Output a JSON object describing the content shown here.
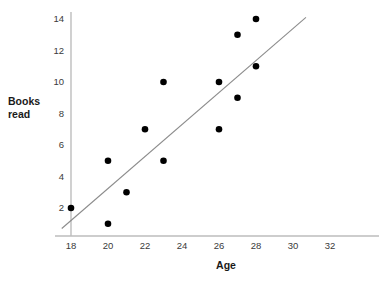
{
  "chart_data": {
    "type": "scatter",
    "title": "",
    "xlabel": "Age",
    "ylabel": "Books read",
    "xlim": [
      17.2,
      33.2
    ],
    "ylim": [
      0.2,
      14.8
    ],
    "xticks": [
      18,
      20,
      22,
      24,
      26,
      28,
      30,
      32
    ],
    "yticks": [
      2,
      4,
      6,
      8,
      10,
      12,
      14
    ],
    "xtick_labels": [
      "18",
      "20",
      "22",
      "24",
      "26",
      "28",
      "30",
      "32"
    ],
    "ytick_labels": [
      "2",
      "4",
      "6",
      "8",
      "10",
      "12",
      "14"
    ],
    "grid": false,
    "legend": null,
    "x": [
      18,
      20,
      20,
      21,
      22,
      23,
      23,
      26,
      26,
      27,
      27,
      28,
      28
    ],
    "y": [
      2,
      5,
      1,
      3,
      7,
      10,
      5,
      10,
      7,
      13,
      9,
      14,
      11
    ],
    "points": [
      {
        "x": 18,
        "y": 2
      },
      {
        "x": 20,
        "y": 5
      },
      {
        "x": 20,
        "y": 1
      },
      {
        "x": 21,
        "y": 3
      },
      {
        "x": 22,
        "y": 7
      },
      {
        "x": 23,
        "y": 10
      },
      {
        "x": 23,
        "y": 5
      },
      {
        "x": 26,
        "y": 10
      },
      {
        "x": 26,
        "y": 7
      },
      {
        "x": 27,
        "y": 13
      },
      {
        "x": 27,
        "y": 9
      },
      {
        "x": 28,
        "y": 14
      },
      {
        "x": 28,
        "y": 11
      }
    ],
    "marker_color": "#000000",
    "marker_size": 4.6,
    "trendline": {
      "name": "line of best fit",
      "x1": 17.5,
      "y1": 0.7,
      "x2": 30.7,
      "y2": 14.1,
      "color": "#8c8c8c",
      "width": 1.1
    },
    "axis_color": "#b8b8b8",
    "tick_color": "#3a3a3a",
    "background": "#ffffff"
  },
  "labels": {
    "y_axis_line1": "Books",
    "y_axis_line2": "read",
    "x_axis": "Age"
  }
}
